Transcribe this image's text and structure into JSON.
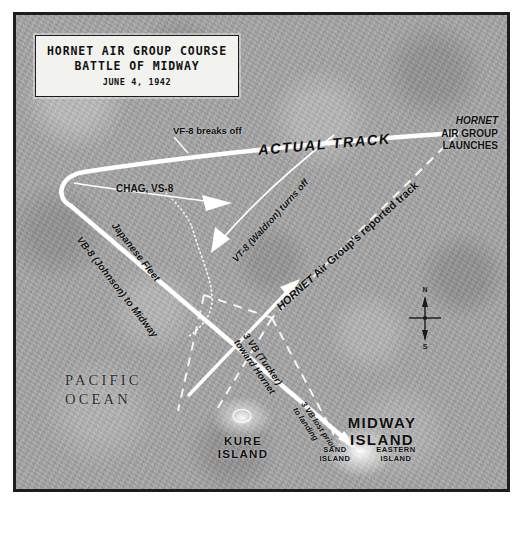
{
  "title": {
    "line1": "HORNET AIR GROUP COURSE",
    "line2": "BATTLE OF MIDWAY",
    "line3": "JUNE 4, 1942"
  },
  "map": {
    "ocean_line1": "PACIFIC",
    "ocean_line2": "OCEAN",
    "actual_track": "ACTUAL TRACK",
    "launch_italic": "HORNET",
    "launch_line2": "AIR GROUP",
    "launch_line3": "LAUNCHES",
    "vf8_breaks_off": "VF-8 breaks off",
    "chag_vs8": "CHAG, VS-8",
    "vt8_turns_off": "VT-8 (Waldron) turns off",
    "reported_track_italic": "HORNET",
    "reported_track_rest": " Air Group's reported track",
    "japanese_fleet": "Japanese Fleet",
    "vb8_to_midway": "VB-8 (Johnson) to Midway",
    "tucker_line1": "3 VB (Tucker)",
    "tucker_line2": "toward Hornet",
    "lost_line1": "3 VB lost prior",
    "lost_line2": "to landing",
    "midway_line1": "MIDWAY",
    "midway_line2": "ISLAND",
    "kure_line1": "KURE",
    "kure_line2": "ISLAND",
    "sand_line1": "SAND",
    "sand_line2": "ISLAND",
    "eastern_line1": "EASTERN",
    "eastern_line2": "ISLAND"
  },
  "compass": {
    "north": "N",
    "south": "S"
  },
  "colors": {
    "paper": "#a6a6a6",
    "border": "#1d1d1d",
    "track": "#ffffff",
    "text": "#111111",
    "cartouche": "#f2f2ef"
  }
}
